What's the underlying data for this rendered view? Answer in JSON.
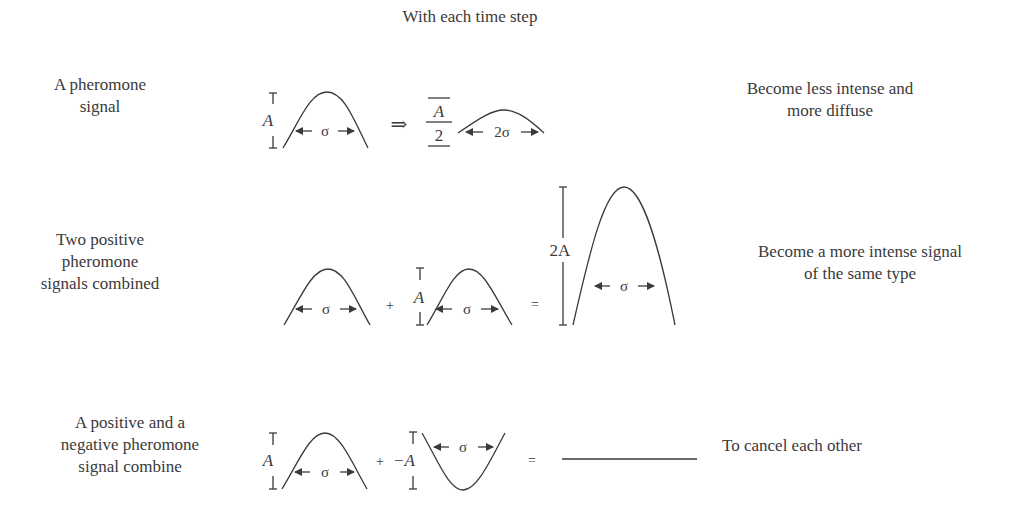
{
  "header": {
    "title": "With each time step"
  },
  "rows": [
    {
      "left_label": "A pheromone\nsignal",
      "right_label": "Become less intense and\nmore diffuse",
      "equation": {
        "amplitude_label": "A",
        "operator": "⇒",
        "result_amplitude_num": "A",
        "result_amplitude_den": "2",
        "width_label": "σ",
        "result_width_label": "2σ"
      }
    },
    {
      "left_label": "Two positive\npheromone\nsignals combined",
      "right_label": "Become a more intense signal\nof the same type",
      "equation": {
        "amplitude_label": "A",
        "plus": "+",
        "equals": "=",
        "width_label": "σ",
        "result_amplitude_label": "2A"
      }
    },
    {
      "left_label": "A positive and a\nnegative pheromone\nsignal combine",
      "right_label": "To cancel each other",
      "equation": {
        "amplitude_label": "A",
        "plus": "+",
        "neg_amplitude_label": "−A",
        "equals": "=",
        "width_label": "σ"
      }
    }
  ],
  "colors": {
    "ink": "#3a3a3a",
    "background": "#ffffff"
  }
}
